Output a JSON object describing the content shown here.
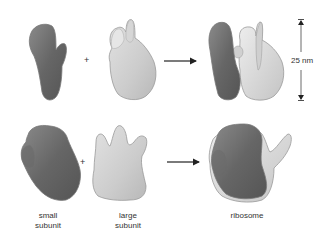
{
  "diagram": {
    "rows": [
      {
        "view": "top",
        "operator": "+",
        "arrow": "right-arrow"
      },
      {
        "view": "bottom",
        "operator": "+",
        "arrow": "right-arrow"
      }
    ],
    "labels": {
      "small_subunit_line1": "small",
      "small_subunit_line2": "subunit",
      "large_subunit_line1": "large",
      "large_subunit_line2": "subunit",
      "ribosome": "ribosome"
    },
    "scale_bar": {
      "label": "25 nm"
    },
    "colors": {
      "small_subunit": "#6e6e6e",
      "large_subunit": "#cfcfcf",
      "outline": "#8a8a8a",
      "text": "#333333"
    }
  }
}
